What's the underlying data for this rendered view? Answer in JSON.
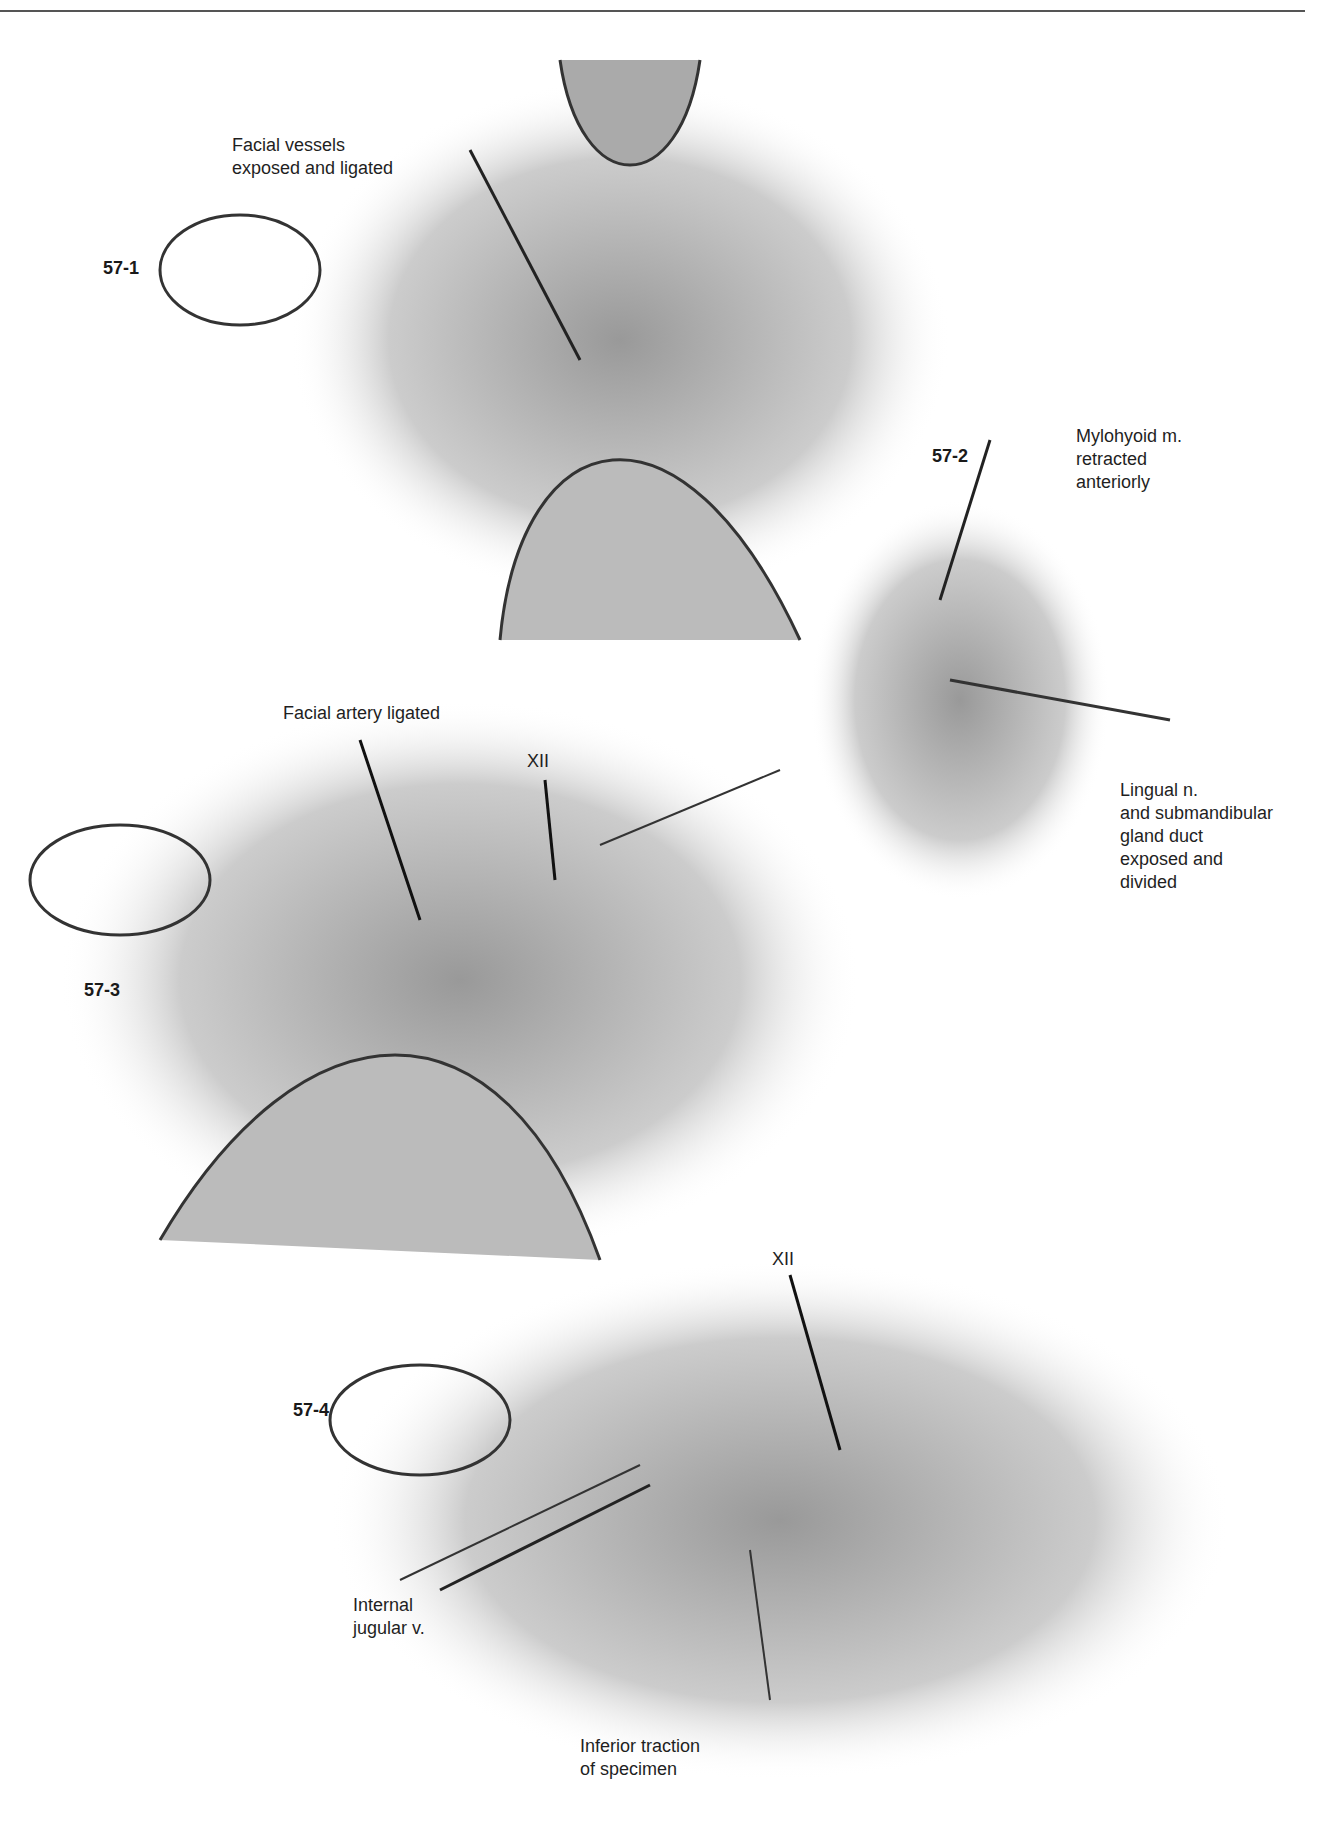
{
  "header": {
    "running_text": "Neck Dissection 5|5"
  },
  "figures": [
    {
      "id": "57-1",
      "labels": [
        "Facial vessels",
        "exposed and ligated"
      ]
    },
    {
      "id": "57-2",
      "labels": [
        "Mylohyoid m.",
        "retracted",
        "anteriorly"
      ],
      "labels2": [
        "Lingual n.",
        "and submandibular",
        "gland duct",
        "exposed and",
        "divided"
      ]
    },
    {
      "id": "57-3",
      "labels": [
        "Facial artery ligated"
      ],
      "labels2": [
        "XII"
      ]
    },
    {
      "id": "57-4",
      "labels": [
        "XII"
      ],
      "labels2": [
        "Internal",
        "jugular v."
      ],
      "labels3": [
        "Inferior traction",
        "of specimen"
      ]
    }
  ]
}
